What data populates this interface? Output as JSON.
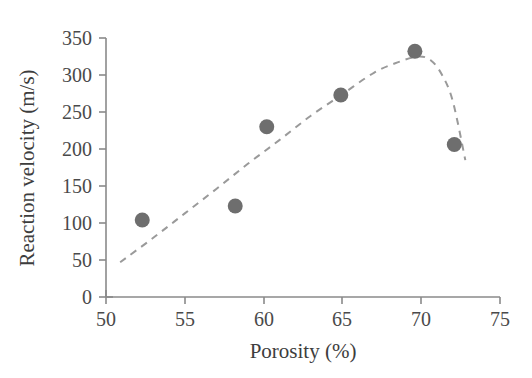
{
  "chart_data": {
    "type": "scatter",
    "title": "",
    "xlabel": "Porosity (%)",
    "ylabel": "Reaction velocity (m/s)",
    "xlim": [
      50,
      75
    ],
    "ylim": [
      0,
      350
    ],
    "xticks": [
      50,
      55,
      60,
      65,
      70,
      75
    ],
    "yticks": [
      0,
      50,
      100,
      150,
      200,
      250,
      300,
      350
    ],
    "xtick_labels": [
      "50",
      "55",
      "60",
      "65",
      "70",
      "75"
    ],
    "ytick_labels": [
      "0",
      "50",
      "100",
      "150",
      "200",
      "250",
      "300",
      "350"
    ],
    "grid": false,
    "legend": null,
    "marker_color": "#6e6e6e",
    "curve_color": "#9a9a9a",
    "axis_color": "#8a8a8a",
    "text_color": "#3d3d3d",
    "series": [
      {
        "name": "Measured reaction velocity",
        "style": "markers",
        "x": [
          52.3,
          58.2,
          60.2,
          64.9,
          69.6,
          72.1
        ],
        "y": [
          104,
          123,
          230,
          273,
          332,
          206
        ]
      },
      {
        "name": "Fitted trend",
        "style": "dashed-curve",
        "x": [
          50.9,
          53.0,
          55.0,
          57.0,
          59.0,
          61.0,
          63.0,
          65.0,
          67.0,
          68.5,
          69.8,
          70.6,
          71.3,
          72.0,
          72.8
        ],
        "y": [
          47,
          80,
          113,
          146,
          180,
          212,
          245,
          274,
          303,
          317,
          325,
          320,
          301,
          265,
          185
        ]
      }
    ]
  }
}
